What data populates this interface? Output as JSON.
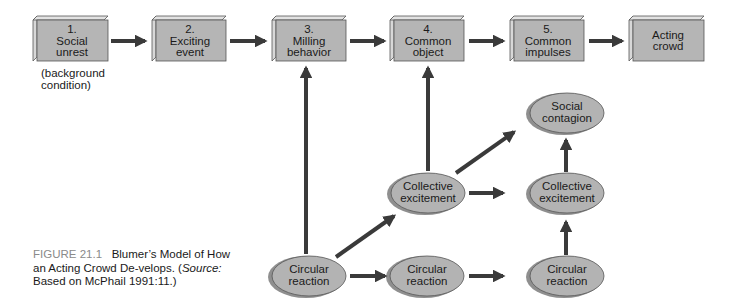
{
  "figure": {
    "label": "FIGURE 21.1",
    "title_part1": "Blumer’s Model of How an Acting Crowd De-velops. (",
    "source_label": "Source:",
    "title_part2": " Based on McPhail 1991:11.)"
  },
  "colors": {
    "box_face": "#b5b5b5",
    "box_side": "#d8d8d8",
    "ellipse_fill": "#b3b3b3",
    "ellipse_shadow": "#8f8f8f",
    "arrow": "#3a3a3a",
    "caption_label": "#8a8a8a"
  },
  "stages": [
    {
      "id": "social-unrest",
      "number": "1.",
      "line1": "Social",
      "line2": "unrest"
    },
    {
      "id": "exciting-event",
      "number": "2.",
      "line1": "Exciting",
      "line2": "event"
    },
    {
      "id": "milling-behavior",
      "number": "3.",
      "line1": "Milling",
      "line2": "behavior"
    },
    {
      "id": "common-object",
      "number": "4.",
      "line1": "Common",
      "line2": "object"
    },
    {
      "id": "common-impulses",
      "number": "5.",
      "line1": "Common",
      "line2": "impulses"
    },
    {
      "id": "acting-crowd",
      "number": "",
      "line1": "Acting",
      "line2": "crowd"
    }
  ],
  "stage1_note": {
    "line1": "(background",
    "line2": "condition)"
  },
  "processes": {
    "social_contagion": {
      "line1": "Social",
      "line2": "contagion"
    },
    "collective_excitement_mid": {
      "line1": "Collective",
      "line2": "excitement"
    },
    "collective_excitement_right": {
      "line1": "Collective",
      "line2": "excitement"
    },
    "circular_reaction_left": {
      "line1": "Circular",
      "line2": "reaction"
    },
    "circular_reaction_mid": {
      "line1": "Circular",
      "line2": "reaction"
    },
    "circular_reaction_right": {
      "line1": "Circular",
      "line2": "reaction"
    }
  }
}
